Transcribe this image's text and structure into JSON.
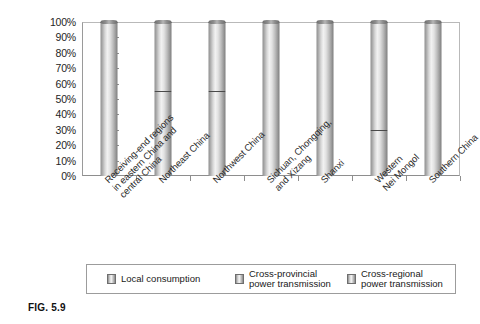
{
  "figure": {
    "caption": "FIG. 5.9"
  },
  "chart_data": {
    "type": "bar",
    "subtype": "100% stacked column",
    "title": "",
    "xlabel": "",
    "ylabel": "",
    "ylim": [
      0,
      100
    ],
    "y_unit": "%",
    "grid": false,
    "legend_position": "bottom",
    "y_tick_labels": [
      "100%",
      "90%",
      "80%",
      "70%",
      "60%",
      "50%",
      "40%",
      "30%",
      "20%",
      "10%",
      "0%"
    ],
    "y_tick_values": [
      100,
      90,
      80,
      70,
      60,
      50,
      40,
      30,
      20,
      10,
      0
    ],
    "categories": [
      "Receiving-end regions\nin eastern China and\ncentral China",
      "Northeast China",
      "Northwest China",
      "Sichuan, Chongqing,\nand Xizang",
      "Shanxi",
      "Western\nNei Mongol",
      "Southern China"
    ],
    "series": [
      {
        "name": "Local consumption",
        "values": [
          52,
          44,
          43,
          100,
          100,
          25,
          100
        ]
      },
      {
        "name": "Cross-provincial power transmission",
        "values": [
          48,
          11,
          12,
          0,
          0,
          5,
          0
        ]
      },
      {
        "name": "Cross-regional power transmission",
        "values": [
          0,
          45,
          45,
          0,
          0,
          70,
          0
        ]
      }
    ],
    "legend": [
      "Local consumption",
      "Cross-provincial\npower transmission",
      "Cross-regional\npower transmission"
    ]
  },
  "colors": {
    "axis": "#8e8e8e",
    "text": "#202020",
    "bar_light": "#f2f2f2",
    "bar_mid": "#bdbdbd",
    "bar_dark": "#7e7e7e",
    "divider": "#4a4a4a"
  }
}
